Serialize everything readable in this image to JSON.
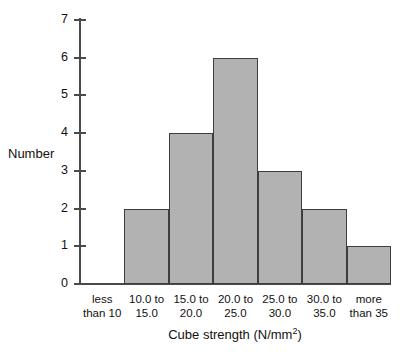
{
  "chart_data": {
    "type": "bar",
    "title": "",
    "xlabel": "Cube strength (N/mm²)",
    "ylabel": "Number",
    "categories": [
      "less than 10",
      "10.0 to 15.0",
      "15.0 to 20.0",
      "20.0 to 25.0",
      "25.0 to 30.0",
      "30.0 to 35.0",
      "more than 35"
    ],
    "category_lines": [
      [
        "less",
        "than 10"
      ],
      [
        "10.0 to",
        "15.0"
      ],
      [
        "15.0 to",
        "20.0"
      ],
      [
        "20.0 to",
        "25.0"
      ],
      [
        "25.0 to",
        "30.0"
      ],
      [
        "30.0 to",
        "35.0"
      ],
      [
        "more",
        "than 35"
      ]
    ],
    "values": [
      0,
      2,
      4,
      6,
      3,
      2,
      1
    ],
    "ylim": [
      0,
      7
    ],
    "ytick_labels": [
      "0",
      "1",
      "2",
      "3",
      "4",
      "5",
      "6",
      "7"
    ],
    "ytick_values": [
      0,
      1,
      2,
      3,
      4,
      5,
      6,
      7
    ],
    "grid": false,
    "legend": false,
    "bar_fill_color": "#b2b2b2",
    "bar_edge_color": "#3d3d3d",
    "axis_color": "#4a4a4a"
  },
  "x_axis_title_parts": {
    "main": "Cube strength (N/mm",
    "superscript": "2",
    "tail": ")"
  }
}
